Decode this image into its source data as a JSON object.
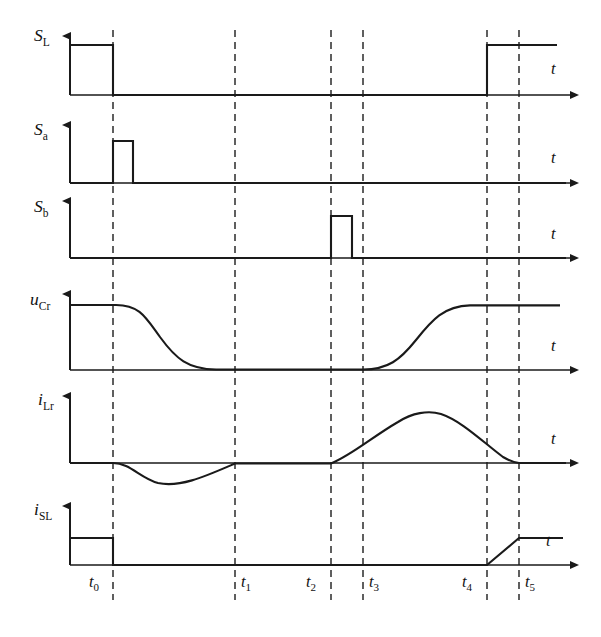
{
  "figure": {
    "kind": "timing-waveform-diagram",
    "background": "#FFFFFF",
    "line_color": "#1A1A1A",
    "guide_color": "#2B2B2B",
    "time_axis_label": "t",
    "width": 601,
    "height": 637
  },
  "time_marks": [
    {
      "id": "t0",
      "base": "t",
      "sub": "0",
      "x": 113
    },
    {
      "id": "t1",
      "base": "t",
      "sub": "1",
      "x": 235
    },
    {
      "id": "t2",
      "base": "t",
      "sub": "2",
      "x": 331
    },
    {
      "id": "t3",
      "base": "t",
      "sub": "3",
      "x": 363
    },
    {
      "id": "t4",
      "base": "t",
      "sub": "4",
      "x": 487
    },
    {
      "id": "t5",
      "base": "t",
      "sub": "5",
      "x": 519
    }
  ],
  "traces": [
    {
      "id": "S_L",
      "label_base": "S",
      "label_sub": "L",
      "label_sub_italic": false,
      "type": "digital",
      "baseline_y": 95,
      "high_y": 45,
      "axis_top_y": 30,
      "axis_end_x": 578,
      "t_label_x": 552,
      "t_label_y": 68,
      "segments": "high from start to t0, low from t0 to t4, high from t4 to end",
      "points": "70,45 113,45 113,95 487,95 487,45 557,45",
      "description": "Main switch gate signal: ON before t0, OFF between t0 and t4, ON again after t4"
    },
    {
      "id": "S_a",
      "label_base": "S",
      "label_sub": "a",
      "label_sub_italic": false,
      "type": "digital",
      "baseline_y": 183,
      "high_y": 141,
      "axis_top_y": 119,
      "axis_end_x": 578,
      "t_label_x": 552,
      "t_label_y": 158,
      "segments": "low until t0, narrow pulse t0 to t0+20, low after",
      "points": "70,183 113,183 113,141 133,141 133,183 566,183",
      "description": "Auxiliary switch a: short pulse starting at t0"
    },
    {
      "id": "S_b",
      "label_base": "S",
      "label_sub": "b",
      "label_sub_italic": false,
      "type": "digital",
      "baseline_y": 258,
      "high_y": 216,
      "axis_top_y": 196,
      "axis_end_x": 578,
      "t_label_x": 552,
      "t_label_y": 234,
      "segments": "low until t2, narrow pulse t2 to just before t3, low after",
      "points": "70,258 331,258 331,216 352,216 352,258 566,258",
      "description": "Auxiliary switch b: short pulse starting at t2, ending just before t3"
    },
    {
      "id": "u_Cr",
      "label_base": "u",
      "label_sub": "Cr",
      "label_sub_italic": false,
      "type": "analog",
      "baseline_y": 370,
      "high_y": 305,
      "axis_top_y": 288,
      "axis_end_x": 578,
      "t_label_x": 552,
      "t_label_y": 346,
      "description": "Resonant capacitor voltage: flat at peak until t0, S-shaped fall to zero by ~x215, zero until t3, S-shaped rise back to peak by t4, flat after"
    },
    {
      "id": "i_Lr",
      "label_base": "i",
      "label_sub": "Lr",
      "label_sub_italic": false,
      "type": "analog",
      "baseline_y": 463,
      "axis_top_y": 390,
      "axis_end_x": 578,
      "t_label_x": 552,
      "t_label_y": 440,
      "description": "Resonant inductor current: zero until t0, negative half sine from t0 to t1 with minimum near x160, zero from t1 to t2, positive hump from t2 peaking near x425 and returning to zero at t5, zero after"
    },
    {
      "id": "i_SL",
      "label_base": "i",
      "label_sub": "SL",
      "label_sub_italic": false,
      "type": "analog",
      "baseline_y": 565,
      "high_y": 538,
      "axis_top_y": 500,
      "axis_end_x": 578,
      "t_label_x": 552,
      "t_label_y": 542,
      "description": "Main switch current: flat positive level until t0, drops to zero, zero until t4, linear ramp from t4 to t5, flat positive after"
    }
  ],
  "axis_geometry": {
    "y_axis_x": 70,
    "plot_right_x": 578,
    "guide_top_y": 30,
    "guide_bottom_y": 600
  }
}
